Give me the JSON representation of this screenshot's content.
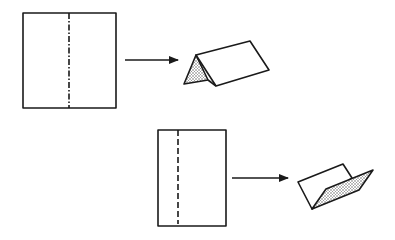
{
  "diagram": {
    "steps": [
      {
        "name": "mountain-fold",
        "fold_line_style": "dash-dot",
        "result": "tent-shaped fold"
      },
      {
        "name": "valley-fold",
        "fold_line_style": "dashed",
        "result": "v-shaped fold"
      }
    ],
    "colors": {
      "line": "#1a1a1a",
      "paper": "#ffffff",
      "shading": "#777777"
    }
  }
}
